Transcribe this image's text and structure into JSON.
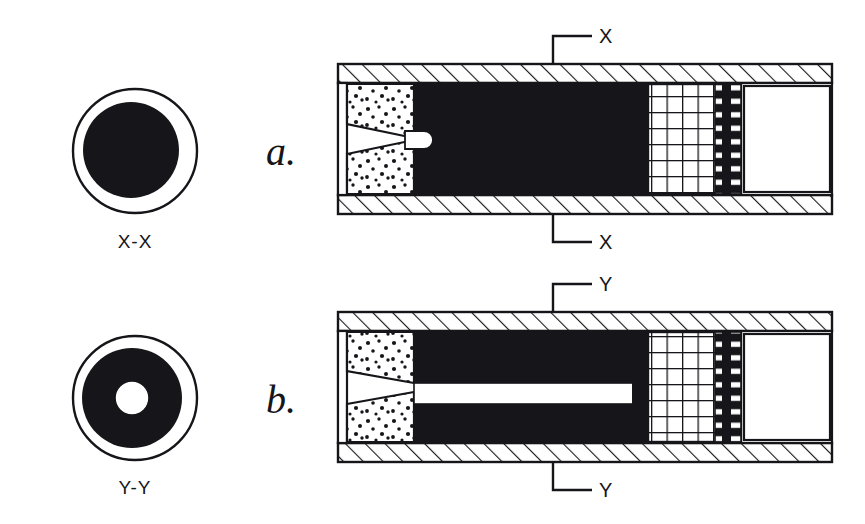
{
  "diagram": {
    "ink_color": "#16161a",
    "paper_color": "#ffffff",
    "fill_black": "#16161a",
    "panels": [
      {
        "id": "a",
        "label": "a.",
        "section_label": "X",
        "cross_section_label": "X-X",
        "core": "solid",
        "description": "Solid black core, stippled base charge with conical cavity, rounded white tip at cone apex, grid region, dark perforated disc, empty chamber at right"
      },
      {
        "id": "b",
        "label": "b.",
        "section_label": "Y",
        "cross_section_label": "Y-Y",
        "core": "hollow",
        "description": "Black core with axial hollow channel, stippled base charge with conical cavity, grid region, dark perforated disc, empty chamber at right"
      }
    ],
    "cross_sections": [
      {
        "label": "X-X",
        "outer_ring": "white annulus",
        "core": "solid black disc",
        "center_hole": false
      },
      {
        "label": "Y-Y",
        "outer_ring": "white annulus",
        "core": "black annulus",
        "center_hole": true
      }
    ],
    "labels": {
      "panel_a": "a.",
      "panel_b": "b.",
      "cross_a": "X-X",
      "cross_b": "Y-Y",
      "mark_a_top": "X",
      "mark_a_bottom": "X",
      "mark_b_top": "Y",
      "mark_b_bottom": "Y"
    },
    "hatching": {
      "style": "diagonal-45",
      "applies_to": "tube walls"
    },
    "stipple": {
      "style": "random dots",
      "applies_to": "base charge region"
    },
    "grid": {
      "columns": 6,
      "rows": 7,
      "applies_to": "right grid region"
    },
    "perforated_disc": {
      "style": "black band with white horizontal dashes",
      "dash_count": 8
    }
  }
}
